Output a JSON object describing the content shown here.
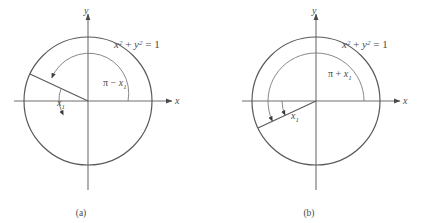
{
  "figure": {
    "type": "unit-circle-diagram-pair",
    "background_color": "#ffffff",
    "stroke_color": "#4a4a4a",
    "panels": [
      {
        "id": "a",
        "caption": "(a)",
        "center": {
          "x": 88,
          "y": 101
        },
        "radius": 64,
        "equation": {
          "full": "x2 + y2 = 1",
          "x_base": "x",
          "x_exp": "2",
          "plus": "+",
          "y_base": "y",
          "y_exp": "2",
          "equals": "=",
          "rhs": "1"
        },
        "axis_x_label": "x",
        "axis_y_label": "y",
        "terminal_angle_deg": 155,
        "angle_labels": [
          {
            "name": "pi-minus-x1",
            "pi": "π",
            "op": "−",
            "var": "x",
            "sub": "1",
            "text": "π − x1"
          },
          {
            "name": "x1-reference",
            "var": "x",
            "sub": "1",
            "text": "x1"
          }
        ],
        "arcs": [
          {
            "name": "principal-arc",
            "from_deg": 0,
            "to_deg": 155,
            "radius": 40,
            "arrowhead": "end"
          },
          {
            "name": "reference-arc",
            "from_deg": 180,
            "to_deg": 155,
            "radius": 30,
            "arrowhead": "start"
          }
        ]
      },
      {
        "id": "b",
        "caption": "(b)",
        "center": {
          "x": 316,
          "y": 101
        },
        "radius": 64,
        "equation": {
          "full": "x2 + y2 = 1",
          "x_base": "x",
          "x_exp": "2",
          "plus": "+",
          "y_base": "y",
          "y_exp": "2",
          "equals": "=",
          "rhs": "1"
        },
        "axis_x_label": "x",
        "axis_y_label": "y",
        "terminal_angle_deg": 205,
        "angle_labels": [
          {
            "name": "pi-plus-x1",
            "pi": "π",
            "op": "+",
            "var": "x",
            "sub": "1",
            "text": "π + x1"
          },
          {
            "name": "x1-reference",
            "var": "x",
            "sub": "1",
            "text": "x1"
          }
        ],
        "arcs": [
          {
            "name": "principal-arc",
            "from_deg": 0,
            "to_deg": 205,
            "radius": 48,
            "arrowhead": "end"
          },
          {
            "name": "reference-arc",
            "from_deg": 180,
            "to_deg": 205,
            "radius": 34,
            "arrowhead": "end"
          }
        ]
      }
    ]
  }
}
